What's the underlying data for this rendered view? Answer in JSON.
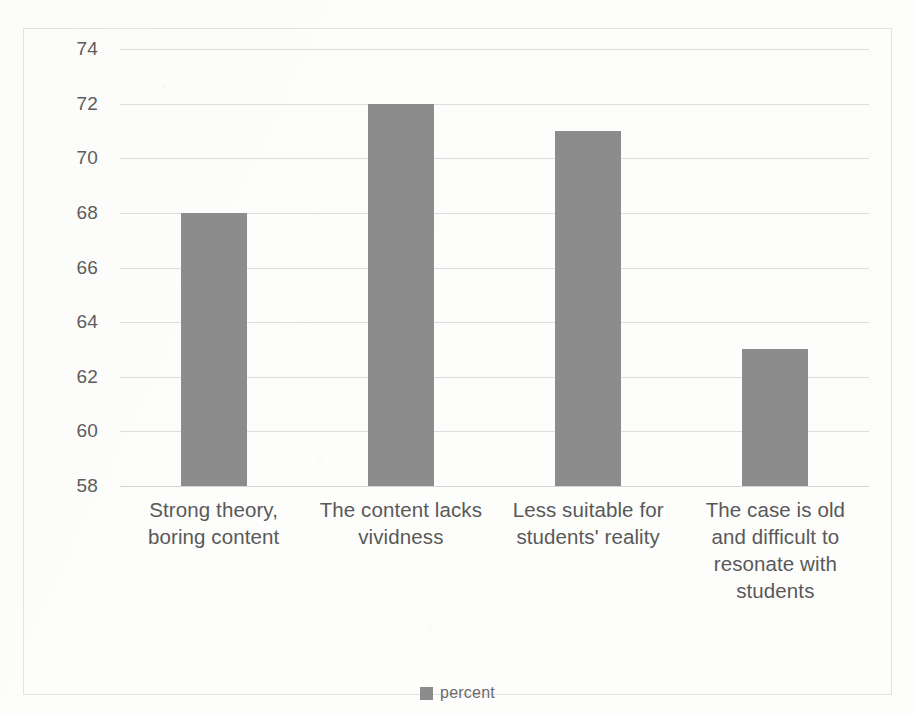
{
  "chart_data": {
    "type": "bar",
    "title": "",
    "subtitle": "",
    "xlabel": "",
    "ylabel": "",
    "ylim": [
      58,
      74
    ],
    "ytick_step": 2,
    "yticks": [
      74,
      72,
      70,
      68,
      66,
      64,
      62,
      60,
      58
    ],
    "grid": true,
    "legend_position": "bottom",
    "categories": [
      "Strong theory, boring content",
      "The content lacks vividness",
      "Less suitable for students' reality",
      "The case is old and difficult to resonate with students"
    ],
    "series": [
      {
        "name": "percent",
        "color": "#8c8c8c",
        "values": [
          68,
          72,
          71,
          63
        ]
      }
    ]
  },
  "legend": {
    "entries": [
      {
        "label": "percent",
        "color": "#8c8c8c",
        "marker": "square-swatch"
      }
    ]
  },
  "colors": {
    "bar": "#8c8c8c",
    "gridline": "#dddddd",
    "frame_border": "#e3e3e3",
    "tick_text": "#5d5d5d",
    "category_text": "#595959",
    "legend_text": "#6a6a6a",
    "background": "#fdfdfc"
  }
}
